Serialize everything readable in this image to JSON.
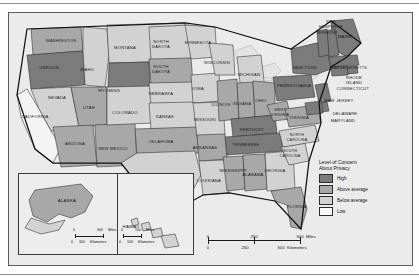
{
  "map": {
    "title": "United States choropleth map",
    "legend": {
      "title_line1": "Level of Concern",
      "title_line2": "About Privacy",
      "items": [
        {
          "label": "High",
          "color": "#7b7b7b",
          "key": "high"
        },
        {
          "label": "Above average",
          "color": "#a8a8a8",
          "key": "above"
        },
        {
          "label": "Below average",
          "color": "#d2d2d2",
          "key": "below"
        },
        {
          "label": "Low",
          "color": "#fbfbfb",
          "key": "low"
        }
      ]
    },
    "scale": {
      "miles": {
        "ticks": [
          "0",
          "250",
          "500"
        ],
        "unit": "Miles"
      },
      "kilometers": {
        "ticks": [
          "0",
          "250",
          "500"
        ],
        "unit": "Kilometers"
      }
    },
    "insets": [
      {
        "name": "ALASKA",
        "scale_miles": {
          "ticks": [
            "0",
            "300"
          ],
          "unit": "Miles"
        },
        "scale_km": {
          "ticks": [
            "0",
            "300"
          ],
          "unit": "Kilometers"
        }
      },
      {
        "name": "HAWAII",
        "scale_miles": {
          "ticks": [
            "0",
            "100"
          ],
          "unit": "Miles"
        },
        "scale_km": {
          "ticks": [
            "0",
            "100"
          ],
          "unit": "Kilometers"
        }
      }
    ],
    "states": [
      {
        "name": "WASHINGTON",
        "level": "above",
        "x": 52,
        "y": 28
      },
      {
        "name": "OREGON",
        "level": "high",
        "x": 40,
        "y": 55
      },
      {
        "name": "IDAHO",
        "level": "below",
        "x": 78,
        "y": 57
      },
      {
        "name": "MONTANA",
        "level": "below",
        "x": 116,
        "y": 35
      },
      {
        "name": "WYOMING",
        "level": "high",
        "x": 100,
        "y": 78
      },
      {
        "name": "NEVADA",
        "level": "below",
        "x": 48,
        "y": 85
      },
      {
        "name": "UTAH",
        "level": "above",
        "x": 80,
        "y": 95
      },
      {
        "name": "CALIFORNIA",
        "level": "low",
        "x": 26,
        "y": 104
      },
      {
        "name": "ARIZONA",
        "level": "above",
        "x": 66,
        "y": 131
      },
      {
        "name": "NEW MEXICO",
        "level": "above",
        "x": 104,
        "y": 136
      },
      {
        "name": "COLORADO",
        "level": "below",
        "x": 116,
        "y": 100
      },
      {
        "name": "NORTH DAKOTA",
        "level": "below",
        "x": 152,
        "y": 32
      },
      {
        "name": "SOUTH DAKOTA",
        "level": "above",
        "x": 152,
        "y": 57
      },
      {
        "name": "NEBRASKA",
        "level": "below",
        "x": 152,
        "y": 81
      },
      {
        "name": "KANSAS",
        "level": "below",
        "x": 156,
        "y": 104
      },
      {
        "name": "OKLAHOMA",
        "level": "above",
        "x": 152,
        "y": 129
      },
      {
        "name": "TEXAS",
        "level": "below",
        "x": 142,
        "y": 170
      },
      {
        "name": "MINNESOTA",
        "level": "below",
        "x": 189,
        "y": 30
      },
      {
        "name": "IOWA",
        "level": "below",
        "x": 189,
        "y": 76
      },
      {
        "name": "MISSOURI",
        "level": "below",
        "x": 196,
        "y": 107
      },
      {
        "name": "ARKANSAS",
        "level": "above",
        "x": 196,
        "y": 135
      },
      {
        "name": "LOUISIANA",
        "level": "below",
        "x": 200,
        "y": 168
      },
      {
        "name": "WISCONSIN",
        "level": "below",
        "x": 208,
        "y": 50
      },
      {
        "name": "ILLINOIS",
        "level": "above",
        "x": 212,
        "y": 92
      },
      {
        "name": "MISSISSIPPI",
        "level": "above",
        "x": 224,
        "y": 158
      },
      {
        "name": "MICHIGAN",
        "level": "below",
        "x": 240,
        "y": 62
      },
      {
        "name": "INDIANA",
        "level": "above",
        "x": 233,
        "y": 91
      },
      {
        "name": "OHIO",
        "level": "above",
        "x": 252,
        "y": 88
      },
      {
        "name": "KENTUCKY",
        "level": "high",
        "x": 243,
        "y": 117
      },
      {
        "name": "TENNESSEE",
        "level": "high",
        "x": 237,
        "y": 132
      },
      {
        "name": "ALABAMA",
        "level": "above",
        "x": 244,
        "y": 162
      },
      {
        "name": "GEORGIA",
        "level": "below",
        "x": 266,
        "y": 158
      },
      {
        "name": "FLORIDA",
        "level": "above",
        "x": 288,
        "y": 194
      },
      {
        "name": "SOUTH CAROLINA",
        "level": "below",
        "x": 281,
        "y": 141
      },
      {
        "name": "NORTH CAROLINA",
        "level": "below",
        "x": 288,
        "y": 125
      },
      {
        "name": "WEST VIRGINIA",
        "level": "above",
        "x": 271,
        "y": 100
      },
      {
        "name": "VIRGINIA",
        "level": "above",
        "x": 290,
        "y": 105
      },
      {
        "name": "PENNSYLVANIA",
        "level": "high",
        "x": 285,
        "y": 73
      },
      {
        "name": "NEW YORK",
        "level": "high",
        "x": 296,
        "y": 55
      },
      {
        "name": "MAINE",
        "level": "high",
        "x": 336,
        "y": 24
      },
      {
        "name": "NEW HAMPSHIRE",
        "level": "high",
        "x": 322,
        "y": 12
      },
      {
        "name": "VERMONT",
        "level": "high",
        "x": 318,
        "y": 20
      },
      {
        "name": "MASSACHUSETTS",
        "level": "high",
        "x": 340,
        "y": 55
      },
      {
        "name": "RHODE ISLAND",
        "level": "high",
        "x": 345,
        "y": 68
      },
      {
        "name": "CONNECTICUT",
        "level": "high",
        "x": 344,
        "y": 76
      },
      {
        "name": "NEW JERSEY",
        "level": "high",
        "x": 330,
        "y": 88
      },
      {
        "name": "DELAWARE",
        "level": "high",
        "x": 336,
        "y": 101
      },
      {
        "name": "MARYLAND",
        "level": "high",
        "x": 334,
        "y": 108
      }
    ]
  }
}
